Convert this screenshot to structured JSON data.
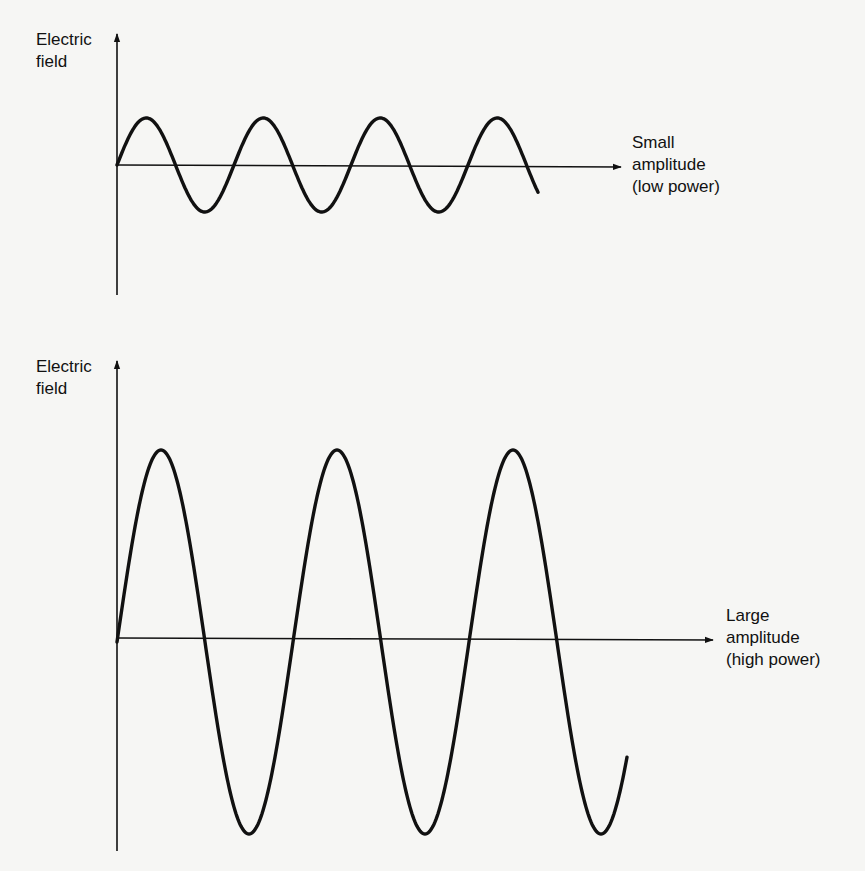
{
  "diagram": {
    "top_panel": {
      "y_axis_label": [
        "Electric",
        "field"
      ],
      "wave_label": [
        "Small",
        "amplitude",
        "(low power)"
      ],
      "amplitude": "small",
      "power": "low"
    },
    "bottom_panel": {
      "y_axis_label": [
        "Electric",
        "field"
      ],
      "wave_label": [
        "Large",
        "amplitude",
        "(high power)"
      ],
      "amplitude": "large",
      "power": "high"
    },
    "colors": {
      "background": "#f6f6f4",
      "ink": "#111111"
    }
  },
  "chart_data": [
    {
      "type": "line",
      "title": "Small amplitude (low power)",
      "ylabel": "Electric field",
      "xlabel": "",
      "series": [
        {
          "name": "wave",
          "function": "sine",
          "amplitude_px": 47,
          "period_px": 117,
          "cycles": 3.6
        }
      ],
      "grid": false
    },
    {
      "type": "line",
      "title": "Large amplitude (high power)",
      "ylabel": "Electric field",
      "xlabel": "",
      "series": [
        {
          "name": "wave",
          "function": "sine",
          "amplitude_px": 192,
          "period_px": 176,
          "cycles": 2.9
        }
      ],
      "grid": false
    }
  ]
}
